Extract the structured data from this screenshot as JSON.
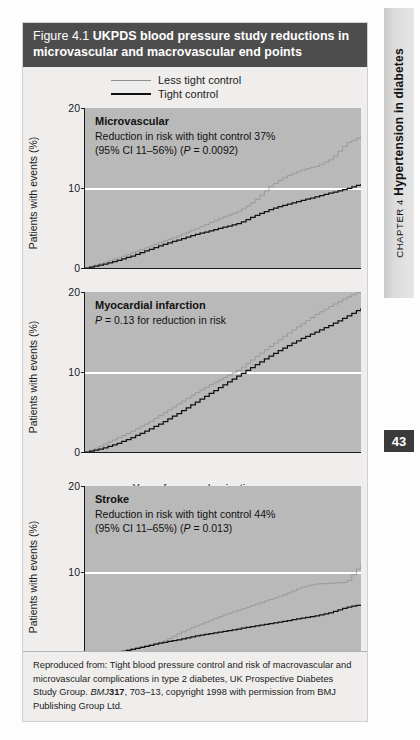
{
  "running_head": {
    "chapter_prefix": "CHAPTER 4",
    "chapter_title": "Hypertension in diabetes",
    "page_number": "43"
  },
  "figure": {
    "number": "Figure 4.1",
    "title": "UKPDS blood pressure study reductions in microvascular and macrovascular end points",
    "legend": [
      {
        "label": "Less tight control",
        "style": "thin-grey",
        "color": "#8e8e8e"
      },
      {
        "label": "Tight control",
        "style": "thick-black",
        "color": "#111111"
      }
    ],
    "axes": {
      "ylabel": "Patients with events (%)",
      "yticks": [
        0,
        10,
        20
      ],
      "ylim": [
        0,
        20
      ],
      "xlabel": "Years from randomization",
      "xticks": [
        0,
        1,
        2,
        3,
        4,
        5,
        6,
        7,
        8,
        9
      ],
      "xlim": [
        0,
        9
      ],
      "gridline_at": 10
    },
    "source_note_prefix": "Reproduced from: Tight blood pressure control and risk of macrovascular and microvascular complications in type 2 diabetes, UK Prospective Diabetes Study Group. ",
    "source_journal": "BMJ",
    "source_volume": "317",
    "source_pages": ", 703–13, ",
    "source_note_suffix": "copyright 1998 with permission from BMJ Publishing Group Ltd."
  },
  "chart_data": [
    {
      "type": "line",
      "panel": "microvascular",
      "title": "Microvascular",
      "annotation_lines": [
        "Reduction in risk with tight control 37%",
        "(95% CI 11–56%) (P = 0.0092)"
      ],
      "reduction_in_risk_pct": 37,
      "ci_low_pct": 11,
      "ci_high_pct": 56,
      "p_value": "0.0092",
      "xlabel": "Years from randomization",
      "ylabel": "Patients with events (%)",
      "xlim": [
        0,
        9
      ],
      "ylim": [
        0,
        20
      ],
      "grid": true,
      "legend_position": "top",
      "x": [
        0,
        0.5,
        1,
        1.5,
        2,
        2.5,
        3,
        3.5,
        4,
        4.5,
        5,
        5.5,
        6,
        6.5,
        7,
        7.5,
        8,
        8.5,
        9
      ],
      "series": [
        {
          "name": "Less tight control",
          "color": "#8e8e8e",
          "values": [
            0,
            0.6,
            1.2,
            1.9,
            2.6,
            3.3,
            4.0,
            4.8,
            5.6,
            6.4,
            7.1,
            8.4,
            10.2,
            11.4,
            12.2,
            12.7,
            13.6,
            15.6,
            16.5
          ]
        },
        {
          "name": "Tight control",
          "color": "#111111",
          "values": [
            0,
            0.4,
            0.9,
            1.5,
            2.2,
            2.9,
            3.5,
            4.1,
            4.6,
            5.1,
            5.6,
            6.5,
            7.3,
            7.9,
            8.4,
            8.9,
            9.4,
            9.9,
            10.5
          ]
        }
      ]
    },
    {
      "type": "line",
      "panel": "myocardial-infarction",
      "title": "Myocardial infarction",
      "annotation_lines": [
        "P = 0.13 for reduction in risk"
      ],
      "p_value": "0.13",
      "xlabel": "Years from randomization",
      "ylabel": "Patients with events (%)",
      "xlim": [
        0,
        9
      ],
      "ylim": [
        0,
        20
      ],
      "grid": true,
      "legend_position": "top",
      "x": [
        0,
        0.5,
        1,
        1.5,
        2,
        2.5,
        3,
        3.5,
        4,
        4.5,
        5,
        5.5,
        6,
        6.5,
        7,
        7.5,
        8,
        8.5,
        9
      ],
      "series": [
        {
          "name": "Less tight control",
          "color": "#8e8e8e",
          "values": [
            0,
            0.8,
            1.7,
            2.6,
            3.6,
            4.8,
            6.0,
            7.2,
            8.3,
            9.3,
            10.3,
            11.8,
            13.2,
            14.6,
            15.9,
            17.2,
            18.3,
            19.3,
            20.2
          ]
        },
        {
          "name": "Tight control",
          "color": "#111111",
          "values": [
            0,
            0.4,
            1.0,
            1.8,
            2.7,
            3.7,
            4.8,
            6.0,
            7.2,
            8.4,
            9.6,
            10.8,
            12.0,
            13.1,
            14.1,
            15.0,
            15.9,
            16.9,
            18.0
          ]
        }
      ]
    },
    {
      "type": "line",
      "panel": "stroke",
      "title": "Stroke",
      "annotation_lines": [
        "Reduction in risk with tight control 44%",
        "(95% CI 11–65%) (P = 0.013)"
      ],
      "reduction_in_risk_pct": 44,
      "ci_low_pct": 11,
      "ci_high_pct": 65,
      "p_value": "0.013",
      "xlabel": "Years from randomization",
      "ylabel": "Patients with events (%)",
      "xlim": [
        0,
        9
      ],
      "ylim": [
        0,
        20
      ],
      "grid": true,
      "legend_position": "top",
      "x": [
        0,
        0.5,
        1,
        1.5,
        2,
        2.5,
        3,
        3.5,
        4,
        4.5,
        5,
        5.5,
        6,
        6.5,
        7,
        7.5,
        8,
        8.5,
        9
      ],
      "series": [
        {
          "name": "Less tight control",
          "color": "#8e8e8e",
          "values": [
            0,
            0.3,
            0.7,
            1.1,
            1.5,
            1.9,
            2.8,
            3.6,
            4.3,
            5.0,
            5.6,
            6.2,
            6.8,
            7.4,
            8.2,
            8.6,
            8.7,
            8.8,
            11.0
          ]
        },
        {
          "name": "Tight control",
          "color": "#111111",
          "values": [
            0,
            0.3,
            0.6,
            1.0,
            1.4,
            1.8,
            2.1,
            2.5,
            2.8,
            3.1,
            3.4,
            3.7,
            4.0,
            4.3,
            4.6,
            4.9,
            5.3,
            5.9,
            6.2
          ]
        }
      ]
    }
  ]
}
